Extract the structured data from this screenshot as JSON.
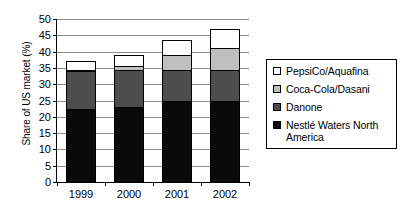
{
  "chart_data": {
    "type": "bar",
    "stacked": true,
    "title": "",
    "xlabel": "",
    "ylabel": "Share of US market (%)",
    "categories": [
      "1999",
      "2000",
      "2001",
      "2002"
    ],
    "ylim": [
      0,
      50
    ],
    "yticks": [
      0,
      5,
      10,
      15,
      20,
      25,
      30,
      35,
      40,
      45,
      50
    ],
    "ytick_labels": [
      "0",
      "5",
      "10",
      "15",
      "20",
      "25",
      "30",
      "35",
      "40",
      "45",
      "50"
    ],
    "grid": true,
    "legend_position": "right",
    "series": [
      {
        "name": "Nestlé Waters North America",
        "color": "#0a0a0a",
        "values": [
          22.5,
          23.0,
          25.0,
          25.0
        ]
      },
      {
        "name": "Danone",
        "color": "#4d4d4d",
        "values": [
          11.5,
          11.5,
          9.5,
          9.5
        ]
      },
      {
        "name": "Coca-Cola/Dasani",
        "color": "#bfbfbf",
        "values": [
          0.5,
          1.0,
          4.5,
          6.5
        ]
      },
      {
        "name": "PepsiCo/Aquafina",
        "color": "#ffffff",
        "values": [
          2.5,
          3.5,
          4.5,
          6.0
        ]
      }
    ],
    "stack_totals": [
      37.0,
      39.0,
      43.5,
      47.0
    ]
  },
  "legend": {
    "items": [
      {
        "label": "PepsiCo/Aquafina",
        "swatch": "legend-swatch-pepsico"
      },
      {
        "label": "Coca-Cola/Dasani",
        "swatch": "legend-swatch-cocacola"
      },
      {
        "label": "Danone",
        "swatch": "legend-swatch-danone"
      },
      {
        "label": "Nestlé Waters North America",
        "swatch": "legend-swatch-nestle"
      }
    ]
  }
}
